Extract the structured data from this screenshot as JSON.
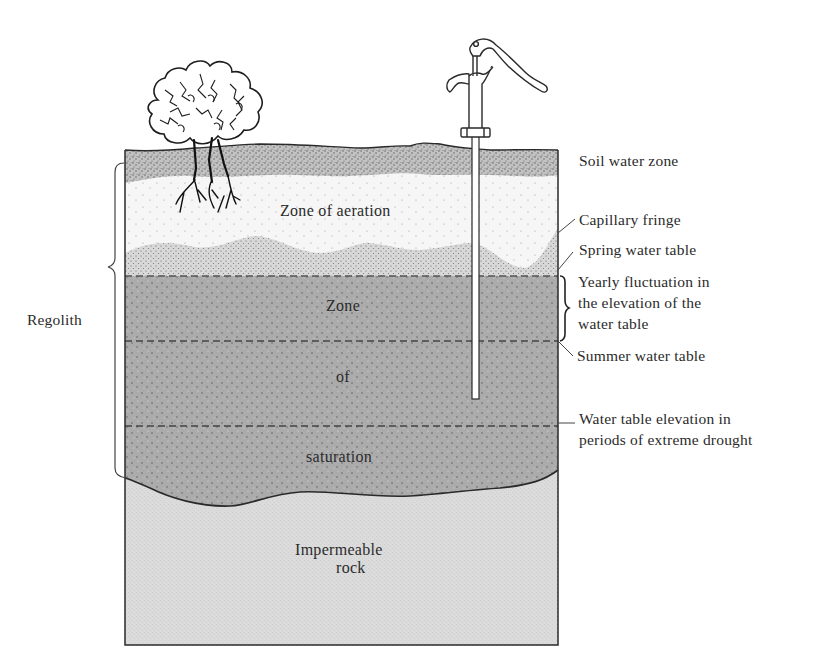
{
  "diagram": {
    "zones": {
      "aeration": "Zone of aeration",
      "saturation_1": "Zone",
      "saturation_2": "of",
      "saturation_3": "saturation",
      "rock_1": "Impermeable",
      "rock_2": "rock"
    },
    "left_labels": {
      "regolith": "Regolith"
    },
    "right_labels": {
      "soil_water_zone": "Soil water zone",
      "capillary_fringe": "Capillary fringe",
      "spring_water_table": "Spring water table",
      "yearly_fluctuation": "Yearly fluctuation in\nthe elevation of the\nwater table",
      "summer_water_table": "Summer water table",
      "drought_water_table": "Water table elevation in\nperiods of extreme drought"
    },
    "illustrations": [
      "tree-icon",
      "hand-pump-icon",
      "well-pipe"
    ],
    "colors": {
      "soil": "#b9b9b9",
      "aeration": "#f4f4f4",
      "capillary": "#cfcfcf",
      "saturation": "#a9a9a9",
      "rock": "#dadada",
      "outline": "#2a2a2a"
    }
  }
}
